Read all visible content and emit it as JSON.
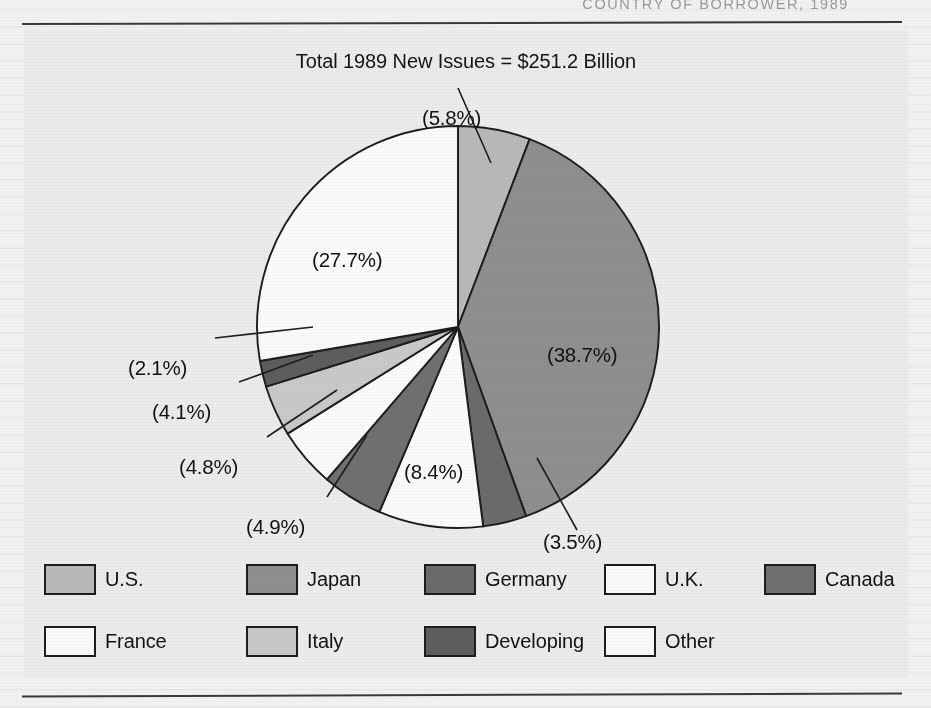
{
  "running_head": "COUNTRY OF BORROWER, 1989",
  "figure": {
    "title": "Total 1989 New Issues = $251.2 Billion"
  },
  "colors": {
    "us": "#b9b9b9",
    "japan": "#8f8f8f",
    "germany": "#6b6b6b",
    "uk": "#fbfbfb",
    "canada": "#707070",
    "france": "#fbfbfb",
    "italy": "#c9c9c9",
    "developing": "#5e5e5e",
    "other": "#fbfbfb",
    "outline": "#1d1d1d",
    "panel": "#ececeb",
    "page": "#f2f2f0",
    "rule": "#3a3a3a"
  },
  "chart_data": {
    "type": "pie",
    "title": "Total 1989 New Issues = $251.2 Billion",
    "total_label": "$251.2 Billion",
    "total_value": 251.2,
    "units": "billions of U.S. dollars",
    "year": 1989,
    "value_format": "percent",
    "start_angle_deg": 0,
    "direction": "clockwise",
    "legend_position": "bottom",
    "grid": false,
    "categories": [
      "U.S.",
      "Japan",
      "Germany",
      "U.K.",
      "Canada",
      "France",
      "Italy",
      "Developing",
      "Other"
    ],
    "values": [
      5.8,
      38.7,
      3.5,
      8.4,
      4.9,
      4.8,
      4.1,
      2.1,
      27.7
    ],
    "labels": [
      "(5.8%)",
      "(38.7%)",
      "(3.5%)",
      "(8.4%)",
      "(4.9%)",
      "(4.8%)",
      "(4.1%)",
      "(2.1%)",
      "(27.7%)"
    ],
    "slice_colors": [
      "#b9b9b9",
      "#8f8f8f",
      "#6b6b6b",
      "#fbfbfb",
      "#707070",
      "#fbfbfb",
      "#c9c9c9",
      "#5e5e5e",
      "#fbfbfb"
    ]
  },
  "pie_labels": {
    "us": "(5.8%)",
    "japan": "(38.7%)",
    "germany": "(3.5%)",
    "uk": "(8.4%)",
    "canada": "(4.9%)",
    "france": "(4.8%)",
    "italy": "(4.1%)",
    "developing": "(2.1%)",
    "other": "(27.7%)"
  },
  "legend": {
    "row1": [
      {
        "label": "U.S.",
        "key": "us"
      },
      {
        "label": "Japan",
        "key": "japan"
      },
      {
        "label": "Germany",
        "key": "germany"
      },
      {
        "label": "U.K.",
        "key": "uk"
      },
      {
        "label": "Canada",
        "key": "canada"
      }
    ],
    "row2": [
      {
        "label": "France",
        "key": "france"
      },
      {
        "label": "Italy",
        "key": "italy"
      },
      {
        "label": "Developing",
        "key": "developing"
      },
      {
        "label": "Other",
        "key": "other"
      }
    ]
  }
}
